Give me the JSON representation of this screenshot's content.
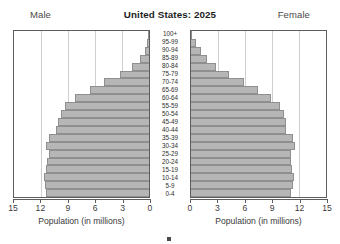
{
  "header": {
    "title": "United States: 2025",
    "left_label": "Male",
    "right_label": "Female"
  },
  "axes": {
    "male": {
      "title": "Population (in millions)",
      "ticks": [
        15,
        12,
        9,
        6,
        3,
        0
      ]
    },
    "female": {
      "title": "Population (in millions)",
      "ticks": [
        0,
        3,
        6,
        9,
        12,
        15
      ]
    }
  },
  "legend": {
    "swatch_color": "#4a4a4a",
    "text": ""
  },
  "colors": {
    "bar_fill": "#b6b6b6",
    "bar_border": "#8f8f8f",
    "panel_border": "#5d5d5d",
    "gridline": "#cfcfcf"
  },
  "chart_data": {
    "type": "bar",
    "subtype": "population-pyramid",
    "title": "United States: 2025",
    "xlabel": "Population (in millions)",
    "ylabel": "",
    "xlim": [
      0,
      15
    ],
    "xticks": [
      0,
      3,
      6,
      9,
      12,
      15
    ],
    "grid": true,
    "legend_position": "bottom",
    "orientation": "horizontal",
    "categories": [
      "100+",
      "95-99",
      "90-94",
      "85-89",
      "80-84",
      "75-79",
      "70-74",
      "65-69",
      "60-64",
      "55-59",
      "50-54",
      "45-49",
      "40-44",
      "35-39",
      "30-34",
      "25-29",
      "20-24",
      "15-19",
      "10-14",
      "5-9",
      "0-4"
    ],
    "series": [
      {
        "name": "Male",
        "side": "left",
        "values": [
          0.05,
          0.2,
          0.5,
          1.0,
          1.9,
          3.2,
          5.0,
          6.6,
          8.2,
          9.3,
          9.8,
          10.1,
          10.3,
          11.1,
          11.5,
          11.1,
          11.3,
          11.5,
          11.7,
          11.6,
          11.4
        ]
      },
      {
        "name": "Female",
        "side": "right",
        "values": [
          0.15,
          0.5,
          1.1,
          1.8,
          2.8,
          4.2,
          5.9,
          7.4,
          8.9,
          9.9,
          10.3,
          10.5,
          10.6,
          11.3,
          11.6,
          11.1,
          11.1,
          11.2,
          11.4,
          11.3,
          11.1
        ]
      }
    ]
  }
}
